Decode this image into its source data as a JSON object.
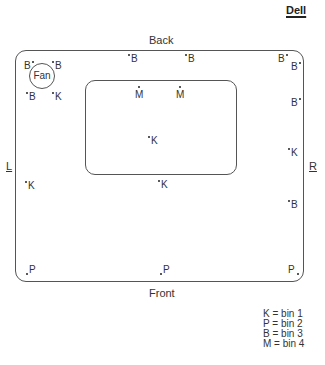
{
  "brand": "Dell",
  "sides": {
    "back": "Back",
    "front": "Front",
    "left": "L",
    "right": "R"
  },
  "fan_label": "Fan",
  "points": [
    {
      "code": "B",
      "x": 24,
      "y": 61,
      "dot": "after"
    },
    {
      "code": "B",
      "x": 52,
      "y": 61,
      "dot": "before"
    },
    {
      "code": "B",
      "x": 26,
      "y": 92,
      "dot": "before"
    },
    {
      "code": "K",
      "x": 52,
      "y": 92,
      "dot": "before"
    },
    {
      "code": "B",
      "x": 128,
      "y": 54,
      "dot": "before"
    },
    {
      "code": "B",
      "x": 185,
      "y": 54,
      "dot": "before"
    },
    {
      "code": "B",
      "x": 278,
      "y": 54,
      "dot": "after"
    },
    {
      "code": "B",
      "x": 291,
      "y": 62,
      "dot": "after"
    },
    {
      "code": "M",
      "x": 135,
      "y": 86,
      "dot": "above"
    },
    {
      "code": "M",
      "x": 176,
      "y": 86,
      "dot": "above"
    },
    {
      "code": "B",
      "x": 291,
      "y": 98,
      "dot": "after"
    },
    {
      "code": "K",
      "x": 148,
      "y": 136,
      "dot": "before"
    },
    {
      "code": "K",
      "x": 288,
      "y": 148,
      "dot": "before"
    },
    {
      "code": "K",
      "x": 158,
      "y": 180,
      "dot": "before"
    },
    {
      "code": "K",
      "x": 25,
      "y": 181,
      "dot": "before"
    },
    {
      "code": "B",
      "x": 288,
      "y": 200,
      "dot": "before"
    },
    {
      "code": "P",
      "x": 26,
      "y": 265,
      "dot": "before-low"
    },
    {
      "code": "P",
      "x": 160,
      "y": 265,
      "dot": "before-low"
    },
    {
      "code": "P",
      "x": 288,
      "y": 265,
      "dot": "after-low"
    }
  ],
  "legend": [
    {
      "code": "K",
      "text": "K = bin 1"
    },
    {
      "code": "P",
      "text": "P = bin 2"
    },
    {
      "code": "B",
      "text": "B = bin 3"
    },
    {
      "code": "M",
      "text": "M = bin 4"
    }
  ]
}
